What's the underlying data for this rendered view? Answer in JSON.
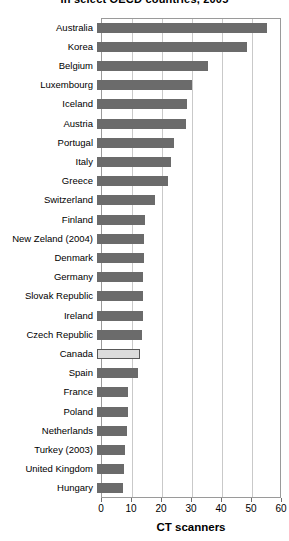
{
  "chart_data": {
    "type": "bar",
    "orientation": "horizontal",
    "title": "in select OECD countries, 2005",
    "xlabel": "CT scanners",
    "ylabel": "",
    "xlim": [
      0,
      60
    ],
    "xticks": [
      0,
      10,
      20,
      30,
      40,
      50,
      60
    ],
    "grid": true,
    "legend": false,
    "highlight_category": "Canada",
    "colors": {
      "bar": "#6b6b6b",
      "highlight_bar": "#dcdcdc",
      "highlight_border": "#585858",
      "gridline": "#c9c9c9",
      "axis": "#9a9a9a",
      "text": "#000000",
      "background": "#ffffff"
    },
    "categories": [
      "Australia",
      "Korea",
      "Belgium",
      "Luxembourg",
      "Iceland",
      "Austria",
      "Portugal",
      "Italy",
      "Greece",
      "Switzerland",
      "Finland",
      "New Zeland (2004)",
      "Denmark",
      "Germany",
      "Slovak Republic",
      "Ireland",
      "Czech Republic",
      "Canada",
      "Spain",
      "France",
      "Poland",
      "Netherlands",
      "Turkey (2003)",
      "United Kingdom",
      "Hungary"
    ],
    "values": [
      56.5,
      50.0,
      37.0,
      31.5,
      30.0,
      29.8,
      25.5,
      24.8,
      23.5,
      19.3,
      16.0,
      15.8,
      15.5,
      15.4,
      15.3,
      15.2,
      15.0,
      14.2,
      13.5,
      10.3,
      10.2,
      10.0,
      9.2,
      9.0,
      8.8
    ]
  }
}
